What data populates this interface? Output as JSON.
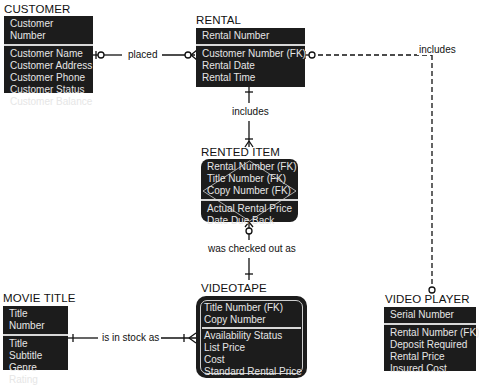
{
  "entities": {
    "customer": {
      "name": "CUSTOMER",
      "key": "Customer Number",
      "attributes": [
        "Customer Name",
        "Customer Address",
        "Customer Phone",
        "Customer Status",
        "Customer Balance"
      ]
    },
    "rental": {
      "name": "RENTAL",
      "key": "Rental Number",
      "attributes": [
        "Customer Number (FK)",
        "Rental Date",
        "Rental Time"
      ]
    },
    "rented_item": {
      "name": "RENTED ITEM",
      "key_lines": [
        "Rental Number (FK)",
        "Title Number (FK)",
        "Copy Number (FK)"
      ],
      "attributes": [
        "Actual Rental Price",
        "Date Due Back"
      ]
    },
    "videotape": {
      "name": "VIDEOTAPE",
      "key_lines": [
        "Title Number (FK)",
        "Copy Number"
      ],
      "attributes": [
        "Availability Status",
        "List Price",
        "Cost",
        "Standard Rental Price"
      ]
    },
    "movie_title": {
      "name": "MOVIE TITLE",
      "key": "Title Number",
      "attributes": [
        "Title",
        "Subtitle",
        "Genre",
        "Rating"
      ]
    },
    "video_player": {
      "name": "VIDEO PLAYER",
      "key": "Serial Number",
      "attributes": [
        "Rental Number (FK)",
        "Deposit Required",
        "Rental Price",
        "Insured Cost"
      ]
    }
  },
  "relationships": {
    "placed": "placed",
    "includes_item": "includes",
    "includes_player": "includes",
    "checked_out": "was checked out as",
    "in_stock": "is in stock as"
  }
}
